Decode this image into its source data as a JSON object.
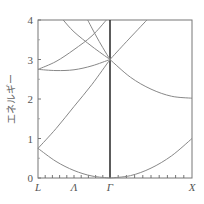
{
  "chart_data": {
    "type": "line",
    "title": "",
    "xlabel": "",
    "ylabel": "エネルギー",
    "ylim": [
      0,
      4
    ],
    "yticks": [
      "0",
      "1",
      "2",
      "3",
      "4"
    ],
    "x_symmetry_points": [
      {
        "label": "L",
        "x": 0.0
      },
      {
        "label": "Λ",
        "x": 0.5
      },
      {
        "label": "Γ",
        "x": 1.0
      },
      {
        "label": "X",
        "x": 2.0
      }
    ],
    "grid": false,
    "legend": null,
    "series": [
      {
        "name": "band-L-lower",
        "points": [
          [
            0.0,
            0.75
          ],
          [
            0.25,
            0.42
          ],
          [
            0.5,
            0.19
          ],
          [
            0.75,
            0.05
          ],
          [
            1.0,
            0.0
          ]
        ]
      },
      {
        "name": "band-L-upper-to-gamma3",
        "points": [
          [
            0.0,
            0.75
          ],
          [
            0.25,
            1.25
          ],
          [
            0.5,
            1.81
          ],
          [
            0.75,
            2.37
          ],
          [
            1.0,
            3.0
          ]
        ]
      },
      {
        "name": "band-L2.75-dip",
        "points": [
          [
            0.0,
            2.75
          ],
          [
            0.25,
            2.72
          ],
          [
            0.5,
            2.74
          ],
          [
            0.75,
            2.84
          ],
          [
            1.0,
            3.0
          ]
        ]
      },
      {
        "name": "band-L2.75-rise",
        "points": [
          [
            0.0,
            2.75
          ],
          [
            0.25,
            2.95
          ],
          [
            0.5,
            3.25
          ],
          [
            0.75,
            3.6
          ],
          [
            0.95,
            4.0
          ]
        ]
      },
      {
        "name": "band-top-left",
        "points": [
          [
            0.35,
            4.0
          ],
          [
            0.5,
            3.7
          ],
          [
            0.75,
            3.33
          ],
          [
            1.0,
            3.0
          ]
        ]
      },
      {
        "name": "band-top-right",
        "points": [
          [
            0.69,
            4.0
          ],
          [
            0.8,
            3.62
          ],
          [
            0.9,
            3.3
          ],
          [
            1.0,
            3.0
          ]
        ]
      },
      {
        "name": "band-gamma-X-lower",
        "points": [
          [
            1.0,
            0.0
          ],
          [
            1.25,
            0.06
          ],
          [
            1.5,
            0.25
          ],
          [
            1.75,
            0.56
          ],
          [
            2.0,
            1.0
          ]
        ]
      },
      {
        "name": "band-gamma-X-rise",
        "points": [
          [
            1.0,
            3.0
          ],
          [
            1.2,
            3.45
          ],
          [
            1.45,
            4.0
          ]
        ]
      },
      {
        "name": "band-gamma-X-fall",
        "points": [
          [
            1.0,
            3.0
          ],
          [
            1.25,
            2.55
          ],
          [
            1.5,
            2.25
          ],
          [
            1.75,
            2.07
          ],
          [
            2.0,
            2.02
          ]
        ]
      }
    ]
  }
}
